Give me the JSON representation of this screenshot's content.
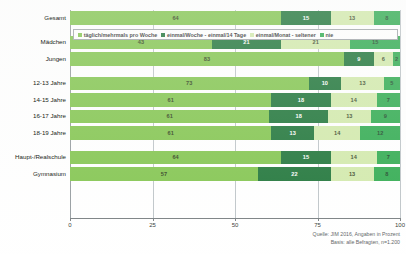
{
  "chart_data": {
    "type": "bar",
    "orientation": "horizontal",
    "stacked": true,
    "normalized_percent": true,
    "title": "",
    "xlabel": "",
    "ylabel": "",
    "xlim": [
      0,
      100
    ],
    "xticks": [
      "0",
      "25",
      "50",
      "75",
      "100"
    ],
    "grid": "vertical",
    "legend_position": "top-inside",
    "categories": [
      "Gesamt",
      "Mädchen",
      "Jungen",
      "12-13 Jahre",
      "14-15 Jahre",
      "16-17 Jahre",
      "18-19 Jahre",
      "Haupt-/Realschule",
      "Gymnasium"
    ],
    "series": [
      {
        "name": "täglich/mehrmals pro Woche",
        "color": "#7ac143",
        "values": [
          64,
          43,
          83,
          73,
          61,
          61,
          61,
          64,
          57
        ]
      },
      {
        "name": "einmal/Woche - einmal/14 Tage",
        "color": "#0f6b2b",
        "values": [
          15,
          21,
          9,
          10,
          18,
          18,
          13,
          15,
          22
        ]
      },
      {
        "name": "einmal/Monat - seltener",
        "color": "#cfe8a6",
        "values": [
          13,
          21,
          6,
          13,
          14,
          13,
          14,
          14,
          13
        ]
      },
      {
        "name": "nie",
        "color": "#22a544",
        "values": [
          8,
          15,
          2,
          5,
          7,
          9,
          12,
          7,
          8
        ]
      }
    ],
    "annotations": [
      "Quelle: JIM 2016, Angaben in Prozent",
      "Basis: alle Befragten, n=1.200"
    ]
  },
  "legend": {
    "items": [
      {
        "label": "täglich/mehrmals pro Woche",
        "color": "#7ac143"
      },
      {
        "label": "einmal/Woche - einmal/14 Tage",
        "color": "#0f6b2b"
      },
      {
        "label": "einmal/Monat - seltener",
        "color": "#cfe8a6"
      },
      {
        "label": "nie",
        "color": "#22a544"
      }
    ]
  },
  "footer": {
    "line1": "Quelle: JIM 2016, Angaben in Prozent",
    "line2": "Basis: alle Befragten, n=1.200"
  }
}
